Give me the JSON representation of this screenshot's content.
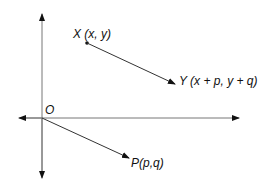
{
  "diagram": {
    "type": "vector-translation",
    "colors": {
      "axis": "#777777",
      "vector": "#333333",
      "text": "#111111"
    },
    "origin": {
      "label": "O"
    },
    "points": {
      "X": {
        "label": "X (x, y)"
      },
      "Y": {
        "label": "Y (x + p, y + q)"
      },
      "P": {
        "label": "P(p,q)"
      }
    },
    "arrows": [
      {
        "from": "X",
        "to": "Y"
      },
      {
        "from": "O",
        "to": "P"
      }
    ]
  }
}
